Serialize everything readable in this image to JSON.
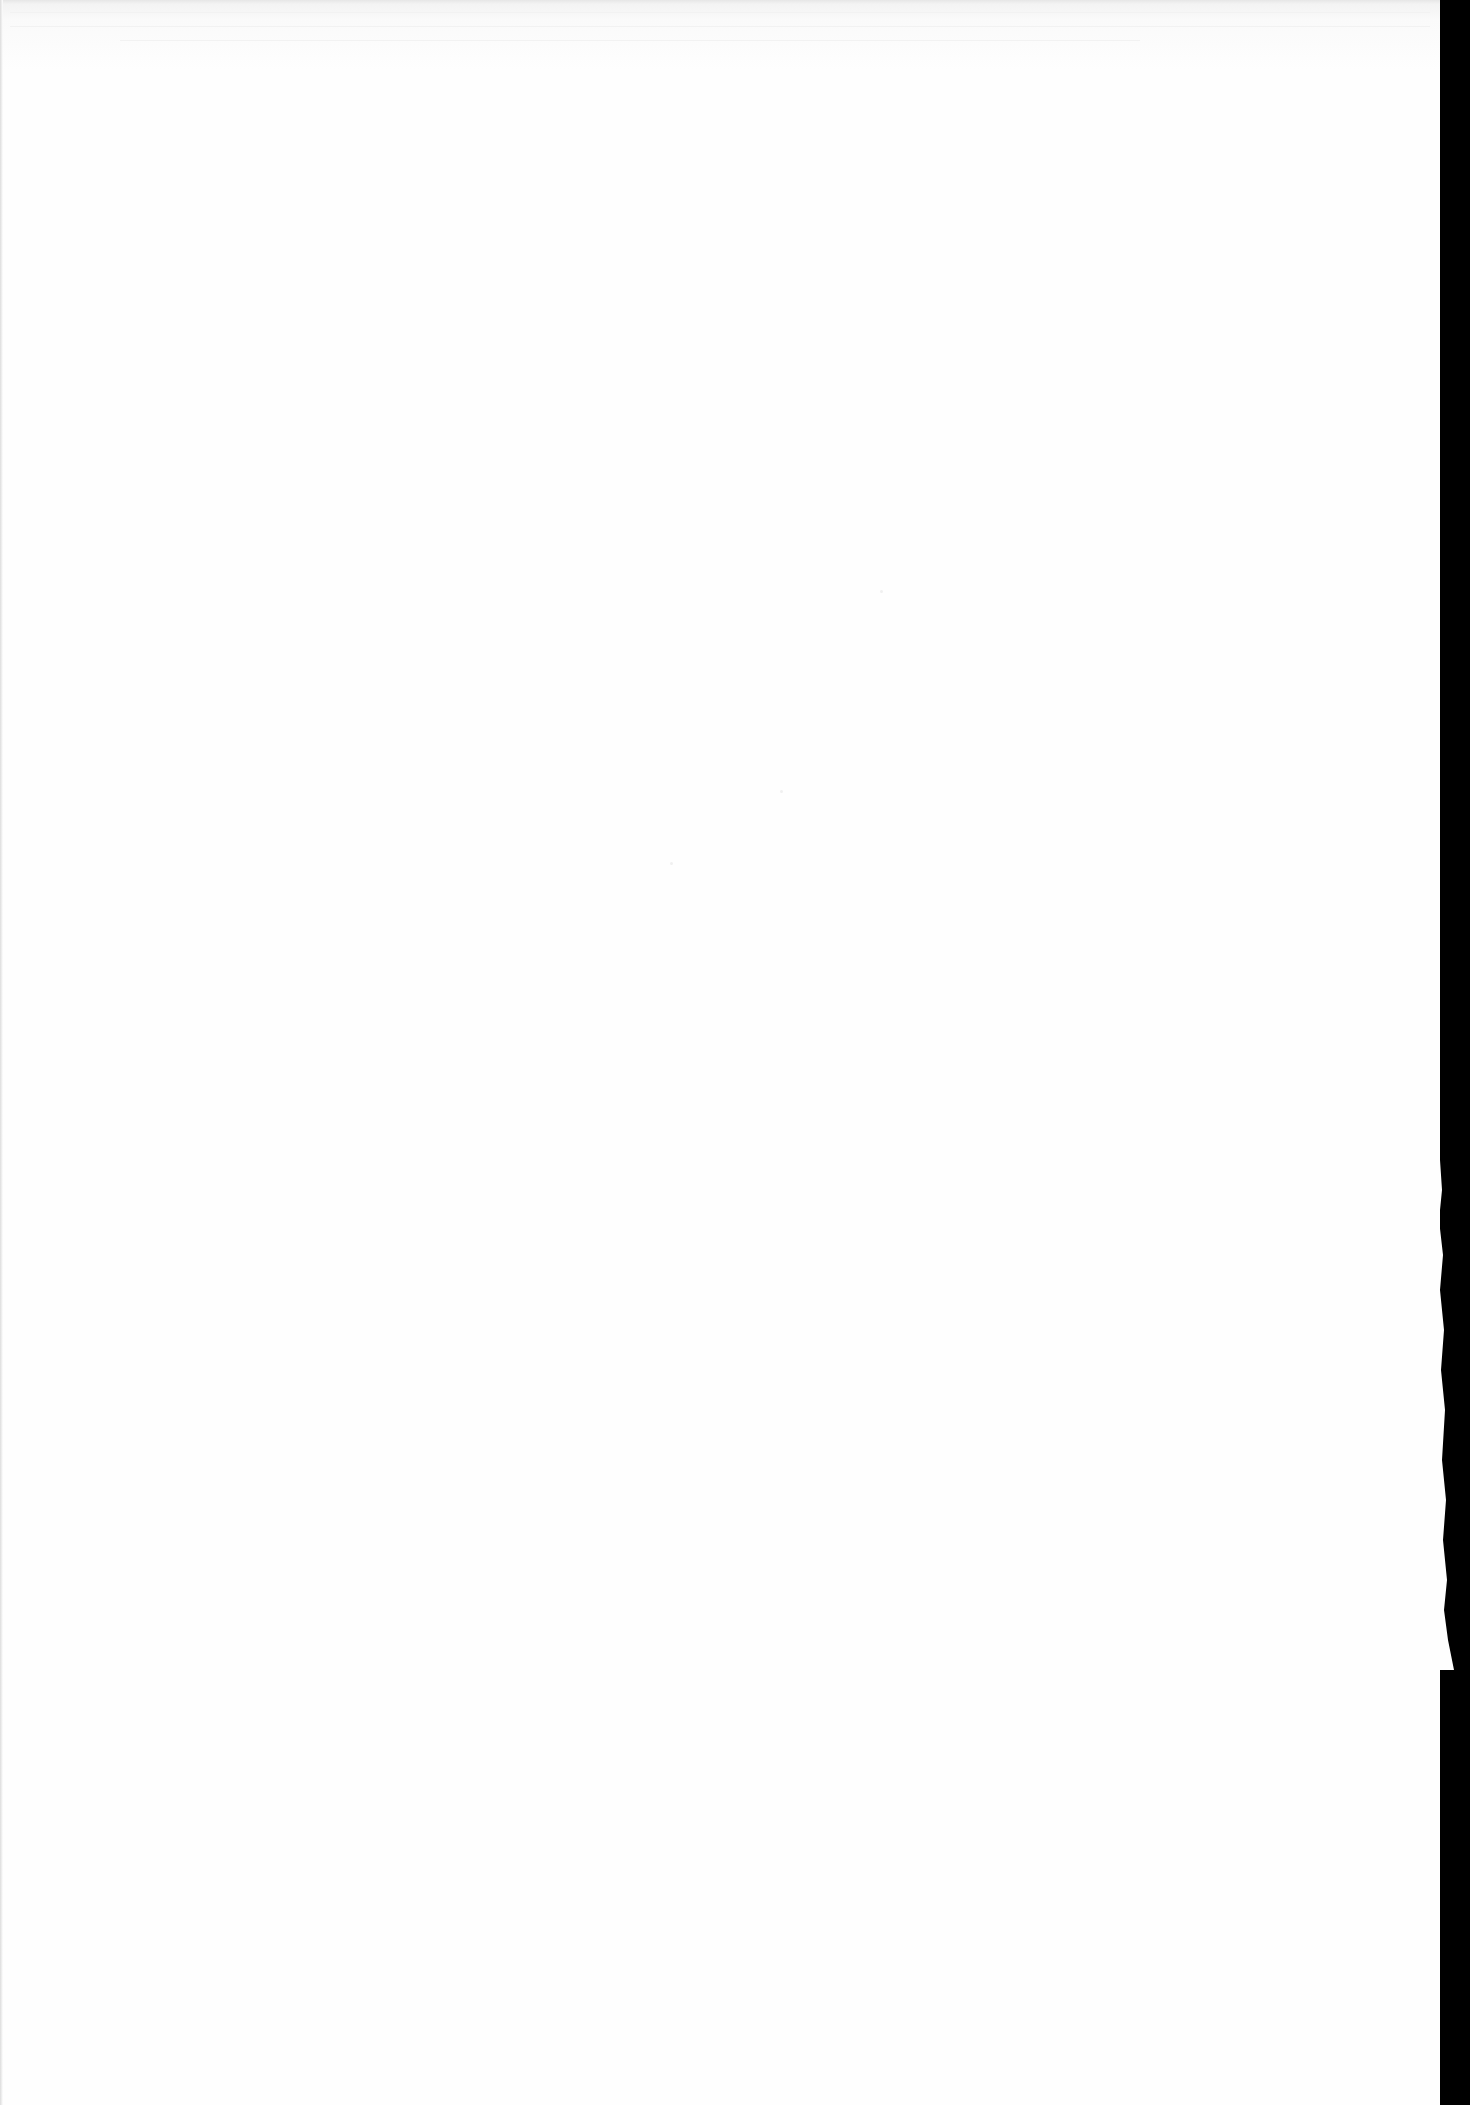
{
  "document": {
    "description": "Blank scanned page",
    "page_color": "#fefefe",
    "background_color": "#000000",
    "text_content": ""
  }
}
